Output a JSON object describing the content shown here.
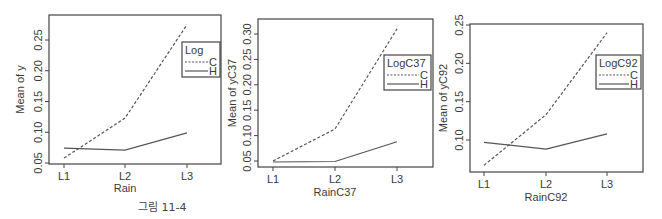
{
  "caption": "그림 11-4",
  "chart_data": [
    {
      "type": "line",
      "title": "",
      "xlabel": "Rain",
      "ylabel": "Mean of  y",
      "categories": [
        "L1",
        "L2",
        "L3"
      ],
      "yticks": [
        "0.05",
        "0.10",
        "0.15",
        "0.20",
        "0.25"
      ],
      "ylim": [
        0.048,
        0.29
      ],
      "legend": {
        "title": "Log",
        "position": "upper-right"
      },
      "series": [
        {
          "name": "C",
          "style": "dashed",
          "values": [
            0.058,
            0.123,
            0.275
          ]
        },
        {
          "name": "H",
          "style": "solid",
          "values": [
            0.074,
            0.071,
            0.099
          ]
        }
      ],
      "grid": false
    },
    {
      "type": "line",
      "title": "",
      "xlabel": "RainC37",
      "ylabel": "Mean of  yC37",
      "categories": [
        "L1",
        "L2",
        "L3"
      ],
      "yticks": [
        "0.05",
        "0.10",
        "0.15",
        "0.20",
        "0.25",
        "0.30"
      ],
      "ylim": [
        0.038,
        0.328
      ],
      "legend": {
        "title": "LogC37",
        "position": "upper-right"
      },
      "series": [
        {
          "name": "C",
          "style": "dashed",
          "values": [
            0.05,
            0.113,
            0.31
          ]
        },
        {
          "name": "H",
          "style": "solid",
          "values": [
            0.048,
            0.049,
            0.088
          ]
        }
      ],
      "grid": false
    },
    {
      "type": "line",
      "title": "",
      "xlabel": "RainC92",
      "ylabel": "Mean of  yC92",
      "categories": [
        "L1",
        "L2",
        "L3"
      ],
      "yticks": [
        "0.10",
        "0.15",
        "0.20",
        "0.25"
      ],
      "ylim": [
        0.058,
        0.25
      ],
      "legend": {
        "title": "LogC92",
        "position": "upper-right"
      },
      "series": [
        {
          "name": "C",
          "style": "dashed",
          "values": [
            0.067,
            0.133,
            0.24
          ]
        },
        {
          "name": "H",
          "style": "solid",
          "values": [
            0.097,
            0.088,
            0.108
          ]
        }
      ],
      "grid": false
    }
  ],
  "colors": {
    "line": "#555555",
    "axis": "#444444",
    "text": "#3a3a3a"
  }
}
